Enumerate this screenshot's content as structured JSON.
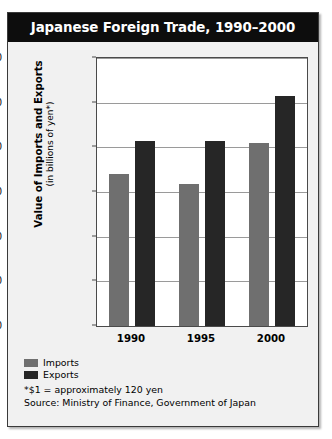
{
  "figure": {
    "title": "Japanese Foreign Trade, 1990–2000",
    "notes": [
      "*$1 = approximately 120 yen",
      "Source: Ministry of Finance, Government of Japan"
    ],
    "colors": {
      "title_bar_background": "#0d0d0d",
      "title_text": "#ffffff",
      "panel_background": "#f1f1f1",
      "plot_background": "#ffffff",
      "gridline": "#9a9a9a",
      "imports": "#6f6f6f",
      "exports": "#262626"
    }
  },
  "chart_data": {
    "type": "bar",
    "title": "Japanese Foreign Trade, 1990–2000",
    "xlabel": "",
    "ylabel": "Value of Imports and Exports",
    "ylabel_sub": "(in billions of yen*)",
    "categories": [
      "1990",
      "1995",
      "2000"
    ],
    "series": [
      {
        "name": "Imports",
        "color": "#6f6f6f",
        "values": [
          34000,
          31800,
          40900
        ]
      },
      {
        "name": "Exports",
        "color": "#262626",
        "values": [
          41500,
          41500,
          51500
        ]
      }
    ],
    "ylim": [
      0,
      60000
    ],
    "ytick_values": [
      0,
      10000,
      20000,
      30000,
      40000,
      50000,
      60000
    ],
    "ytick_labels": [
      "0",
      "10,000",
      "20,000",
      "30,000",
      "40,000",
      "50,000",
      "60,000"
    ],
    "grid": true,
    "legend_position": "bottom-left"
  }
}
